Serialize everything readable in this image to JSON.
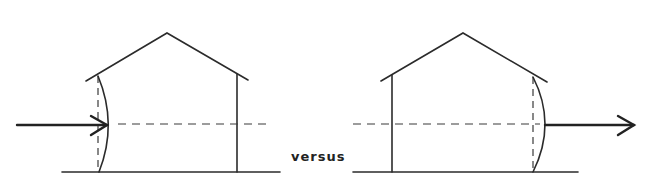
{
  "diagram": {
    "title": "",
    "comparison_label": "versus",
    "panels": [
      {
        "name": "left-house",
        "description": "Arrow entering from left pushing the left wall inward (bulging wall on windward side)",
        "arrow_direction": "right",
        "bulged_wall": "left"
      },
      {
        "name": "right-house",
        "description": "Arrow exiting to right with right wall bulging outward (leeward side)",
        "arrow_direction": "right",
        "bulged_wall": "right"
      }
    ],
    "colors": {
      "line": "#2b2b2b",
      "background": "#ffffff"
    }
  }
}
